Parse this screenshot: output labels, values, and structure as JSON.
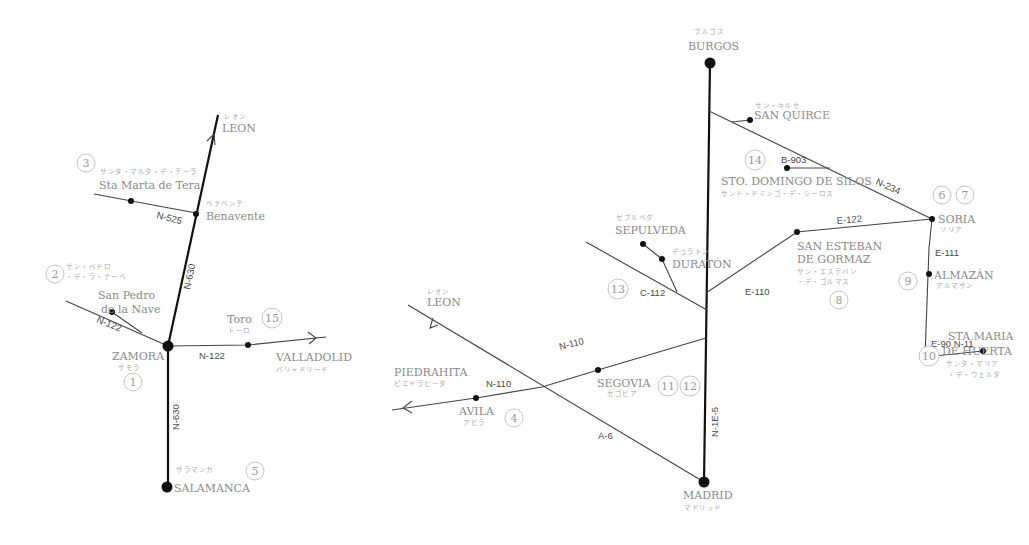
{
  "colors": {
    "road_major": "#111111",
    "road_minor": "#444444",
    "label": "#8a8a8a",
    "kana": "#a8a8a8",
    "badge_border": "#b5b5b5"
  },
  "left_map": {
    "places": {
      "leon": {
        "name": "LEON",
        "kana": "レオン"
      },
      "benavente": {
        "name": "Benavente",
        "kana": "ベナベンテ"
      },
      "sta_marta": {
        "name": "Sta Marta de Tera",
        "kana": "サンタ・マルタ・デ・テーラ"
      },
      "san_pedro_1": {
        "name": "San Pedro"
      },
      "san_pedro_2": {
        "name": "de la Nave"
      },
      "san_pedro_kana_1": {
        "kana": "サン・ペドロ"
      },
      "san_pedro_kana_2": {
        "kana": "・デ・ラ・ナーベ"
      },
      "zamora": {
        "name": "ZAMORA",
        "kana": "サモラ"
      },
      "toro": {
        "name": "Toro",
        "kana": "トーロ"
      },
      "valladolid": {
        "name": "VALLADOLID",
        "kana": "バリャドリード"
      },
      "salamanca": {
        "name": "SALAMANCA",
        "kana": "サラマンカ"
      }
    },
    "roads": {
      "n525": "N-525",
      "n630_north": "N-630",
      "n122_west": "N-122",
      "n122_east": "N-122",
      "n630_south": "N-630"
    },
    "badges": {
      "zamora": "1",
      "san_pedro": "2",
      "sta_marta": "3",
      "salamanca": "5",
      "toro": "15"
    }
  },
  "right_map": {
    "places": {
      "burgos": {
        "name": "BURGOS",
        "kana": "ブルゴス"
      },
      "san_quirce": {
        "name": "SAN QUIRCE",
        "kana": "サン・キルセ"
      },
      "silos": {
        "name": "STO. DOMINGO DE SILOS",
        "kana": "サント・ドミンゴ・デ・シーロス"
      },
      "soria": {
        "name": "SORIA",
        "kana": "ソリア"
      },
      "sepulveda": {
        "name": "SEPULVEDA",
        "kana": "セプルベダ"
      },
      "duraton": {
        "name": "DURATÓN",
        "kana": "デュラトン"
      },
      "san_esteban_1": {
        "name": "SAN ESTEBAN"
      },
      "san_esteban_2": {
        "name": "DE GORMAZ"
      },
      "san_esteban_kana_1": {
        "kana": "サン・エステバン"
      },
      "san_esteban_kana_2": {
        "kana": "・デ・ゴルマス"
      },
      "almazan": {
        "name": "ALMAZÁN",
        "kana": "アルマサン"
      },
      "sta_maria_1": {
        "name": "STA.MARIA"
      },
      "sta_maria_2": {
        "name": "DE HUERTA"
      },
      "sta_maria_kana_1": {
        "kana": "サンタ・マリア"
      },
      "sta_maria_kana_2": {
        "kana": "・デ・ウェルタ"
      },
      "leon": {
        "name": "LEON",
        "kana": "レオン"
      },
      "piedrahita": {
        "name": "PIEDRAHITA",
        "kana": "ピエドラヒータ"
      },
      "avila": {
        "name": "AVILA",
        "kana": "アビラ"
      },
      "segovia": {
        "name": "SEGOVIA",
        "kana": "セゴビア"
      },
      "madrid": {
        "name": "MADRID",
        "kana": "マドリッド"
      }
    },
    "roads": {
      "b903": "B-903",
      "n234": "N-234",
      "e122": "E-122",
      "c112": "C-112",
      "e110": "E-110",
      "e111": "E-111",
      "e90": "E-90 N-11",
      "n110_east": "N-110",
      "n110_west": "N-110",
      "a6": "A-6",
      "n1e5": "N-1E-5"
    },
    "badges": {
      "avila": "4",
      "soria_a": "6",
      "soria_b": "7",
      "san_esteban": "8",
      "almazan": "9",
      "sta_maria": "10",
      "segovia_a": "11",
      "segovia_b": "12",
      "sepulveda": "13",
      "silos": "14"
    }
  }
}
